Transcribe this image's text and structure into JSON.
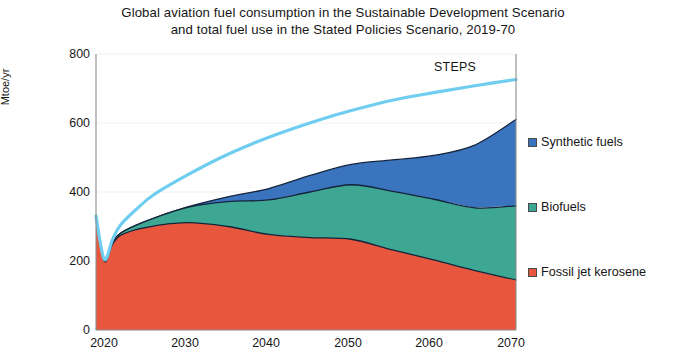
{
  "chart_data": {
    "type": "area",
    "title": "Global aviation fuel consumption in the Sustainable Development Scenario and total fuel use in the Stated Policies Scenario, 2019-70",
    "title_line1": "Global aviation fuel consumption in the Sustainable Development Scenario",
    "title_line2": "and total fuel use in the Stated Policies Scenario, 2019-70",
    "xlabel": "",
    "ylabel": "Mtoe/yr",
    "stacked": true,
    "grid": true,
    "grid_axis": "y",
    "legend_position": "right",
    "xlim": [
      2019,
      2070
    ],
    "ylim": [
      0,
      800
    ],
    "yticks": [
      0,
      200,
      400,
      600,
      800
    ],
    "ytick_labels": [
      "0",
      "200",
      "400",
      "600",
      "800"
    ],
    "xticks": [
      2020,
      2030,
      2040,
      2050,
      2060,
      2070
    ],
    "xtick_labels": [
      "2020",
      "2030",
      "2040",
      "2050",
      "2060",
      "2070"
    ],
    "x": [
      2019,
      2020,
      2021,
      2022,
      2025,
      2030,
      2035,
      2040,
      2045,
      2050,
      2055,
      2060,
      2065,
      2070
    ],
    "series": [
      {
        "name": "Fossil jet kerosene",
        "color": "#E8563D",
        "values": [
          325,
          200,
          248,
          275,
          297,
          311,
          300,
          277,
          268,
          263,
          232,
          203,
          172,
          145
        ]
      },
      {
        "name": "Biofuels",
        "color": "#3EA793",
        "values": [
          2,
          1,
          3,
          6,
          18,
          44,
          72,
          100,
          132,
          158,
          170,
          176,
          182,
          215
        ]
      },
      {
        "name": "Synthetic fuels",
        "color": "#3A74BE",
        "values": [
          0,
          0,
          0,
          0,
          0,
          1,
          14,
          33,
          48,
          59,
          91,
          127,
          182,
          250
        ]
      }
    ],
    "annotations": [
      {
        "name": "STEPS",
        "text": "STEPS",
        "x": 2053,
        "y": 745
      }
    ],
    "reference_line": {
      "name": "STEPS",
      "label": "STEPS",
      "color": "#6FCDF0",
      "x": [
        2019,
        2020,
        2021,
        2022,
        2024,
        2026,
        2030,
        2034,
        2038,
        2042,
        2046,
        2050,
        2055,
        2060,
        2065,
        2070
      ],
      "values": [
        330,
        205,
        262,
        305,
        352,
        392,
        448,
        498,
        540,
        576,
        608,
        636,
        666,
        688,
        708,
        726
      ]
    }
  },
  "legend": {
    "items": [
      {
        "label": "Synthetic fuels",
        "color": "#3A74BE"
      },
      {
        "label": "Biofuels",
        "color": "#3EA793"
      },
      {
        "label": "Fossil jet kerosene",
        "color": "#E8563D"
      }
    ]
  },
  "colors": {
    "fossil": "#E8563D",
    "biofuels": "#3EA793",
    "synthetic": "#3A74BE",
    "steps_line": "#6FCDF0",
    "grid": "#F2F2F2",
    "axis": "#8C8C8C",
    "outline": "#13233B",
    "text": "#161616",
    "background": "#FFFFFF"
  }
}
